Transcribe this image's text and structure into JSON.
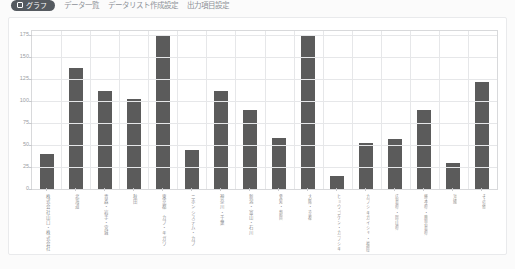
{
  "topbar": {
    "active_tab": {
      "icon": "chart-bar-icon",
      "label": "グラフ"
    },
    "links": [
      "データ一覧",
      "データリスト作成設定",
      "出力項目設定"
    ]
  },
  "chart_data": {
    "type": "bar",
    "title": "",
    "xlabel": "",
    "ylabel": "",
    "ylim": [
      0,
      180
    ],
    "yticks": [
      0,
      25,
      50,
      75,
      100,
      125,
      150,
      175
    ],
    "grid": true,
    "legend": "none",
    "bar_color": "#5b5b5b",
    "categories": [
      "株式会社山口・株式会社",
      "北海道",
      "青森・岩手・宮城",
      "秋田",
      "東京都 カブ・キガワ",
      "ニホンシステム・カブ",
      "神奈川・千葉",
      "新潟・富山・石川",
      "愛知・静岡",
      "大阪・京都",
      "ヒョウゴケン・カブシキ",
      "カブシキガイシャ・福岡支店",
      "広島県・岡山県",
      "熊本県・鹿児島県",
      "沖縄",
      "その他"
    ],
    "values": [
      40,
      138,
      112,
      103,
      175,
      45,
      112,
      90,
      58,
      175,
      15,
      52,
      57,
      90,
      30,
      122
    ]
  }
}
